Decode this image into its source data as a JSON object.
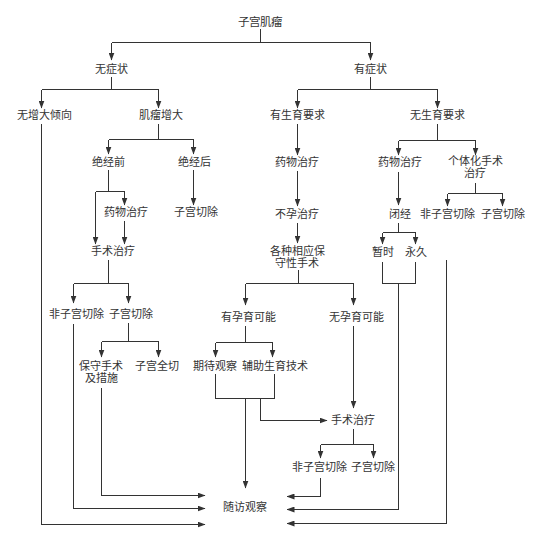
{
  "diagram": {
    "title": "子宫肌瘤",
    "colors": {
      "background": "#ffffff",
      "line": "#333333",
      "text": "#333333"
    },
    "nodes": {
      "root": {
        "label": "子宫肌瘤"
      },
      "asymptomatic": {
        "label": "无症状"
      },
      "symptomatic": {
        "label": "有症状"
      },
      "no_growth_tendency": {
        "label": "无增大倾向"
      },
      "fibroid_growth": {
        "label": "肌瘤增大"
      },
      "premenopausal": {
        "label": "绝经前"
      },
      "postmenopausal": {
        "label": "绝经后"
      },
      "drug_therapy_premeno": {
        "label": "药物治疗"
      },
      "hysterectomy_postmeno": {
        "label": "子宫切除"
      },
      "surgery_premeno": {
        "label": "手术治疗"
      },
      "non_hysterectomy_premeno": {
        "label": "非子宫切除"
      },
      "hysterectomy_premeno": {
        "label": "子宫切除"
      },
      "conservative_measures": {
        "lines": [
          "保守手术",
          "及措施"
        ]
      },
      "total_hysterectomy": {
        "label": "子宫全切"
      },
      "fertility_desired": {
        "label": "有生育要求"
      },
      "fertility_not_desired": {
        "label": "无生育要求"
      },
      "drug_therapy_fertility": {
        "label": "药物治疗"
      },
      "infertility_treatment": {
        "label": "不孕治疗"
      },
      "conservative_surgery": {
        "lines": [
          "各种相应保",
          "守性手术"
        ]
      },
      "pregnancy_possible": {
        "label": "有孕育可能"
      },
      "pregnancy_impossible": {
        "label": "无孕育可能"
      },
      "expectant_observation": {
        "label": "期待观察"
      },
      "assisted_reproduction": {
        "label": "辅助生育技术"
      },
      "surgery_fertility": {
        "label": "手术治疗"
      },
      "non_hysterectomy_fertility": {
        "label": "非子宫切除"
      },
      "hysterectomy_fertility": {
        "label": "子宫切除"
      },
      "drug_therapy_no_fertility": {
        "label": "药物治疗"
      },
      "individualized_surgery": {
        "lines": [
          "个体化手术",
          "治疗"
        ]
      },
      "amenorrhea": {
        "label": "闭经"
      },
      "temporary": {
        "label": "暂时"
      },
      "permanent": {
        "label": "永久"
      },
      "non_hysterectomy_no_fertility": {
        "label": "非子宫切除"
      },
      "hysterectomy_no_fertility": {
        "label": "子宫切除"
      },
      "follow_up": {
        "label": "随访观察"
      }
    },
    "edges": [
      [
        "root",
        "asymptomatic"
      ],
      [
        "root",
        "symptomatic"
      ],
      [
        "asymptomatic",
        "no_growth_tendency"
      ],
      [
        "asymptomatic",
        "fibroid_growth"
      ],
      [
        "no_growth_tendency",
        "follow_up"
      ],
      [
        "fibroid_growth",
        "premenopausal"
      ],
      [
        "fibroid_growth",
        "postmenopausal"
      ],
      [
        "premenopausal",
        "drug_therapy_premeno"
      ],
      [
        "premenopausal",
        "surgery_premeno"
      ],
      [
        "drug_therapy_premeno",
        "surgery_premeno"
      ],
      [
        "postmenopausal",
        "hysterectomy_postmeno"
      ],
      [
        "surgery_premeno",
        "non_hysterectomy_premeno"
      ],
      [
        "surgery_premeno",
        "hysterectomy_premeno"
      ],
      [
        "non_hysterectomy_premeno",
        "follow_up"
      ],
      [
        "hysterectomy_premeno",
        "conservative_measures"
      ],
      [
        "hysterectomy_premeno",
        "total_hysterectomy"
      ],
      [
        "conservative_measures",
        "follow_up"
      ],
      [
        "symptomatic",
        "fertility_desired"
      ],
      [
        "symptomatic",
        "fertility_not_desired"
      ],
      [
        "fertility_desired",
        "drug_therapy_fertility"
      ],
      [
        "drug_therapy_fertility",
        "infertility_treatment"
      ],
      [
        "infertility_treatment",
        "conservative_surgery"
      ],
      [
        "conservative_surgery",
        "pregnancy_possible"
      ],
      [
        "conservative_surgery",
        "pregnancy_impossible"
      ],
      [
        "pregnancy_possible",
        "expectant_observation"
      ],
      [
        "pregnancy_possible",
        "assisted_reproduction"
      ],
      [
        "expectant_observation",
        "follow_up"
      ],
      [
        "assisted_reproduction",
        "follow_up"
      ],
      [
        "expectant_observation",
        "surgery_fertility"
      ],
      [
        "assisted_reproduction",
        "surgery_fertility"
      ],
      [
        "pregnancy_impossible",
        "surgery_fertility"
      ],
      [
        "surgery_fertility",
        "non_hysterectomy_fertility"
      ],
      [
        "surgery_fertility",
        "hysterectomy_fertility"
      ],
      [
        "non_hysterectomy_fertility",
        "follow_up"
      ],
      [
        "fertility_not_desired",
        "drug_therapy_no_fertility"
      ],
      [
        "fertility_not_desired",
        "individualized_surgery"
      ],
      [
        "drug_therapy_no_fertility",
        "amenorrhea"
      ],
      [
        "amenorrhea",
        "temporary"
      ],
      [
        "amenorrhea",
        "permanent"
      ],
      [
        "temporary",
        "follow_up"
      ],
      [
        "permanent",
        "follow_up"
      ],
      [
        "individualized_surgery",
        "non_hysterectomy_no_fertility"
      ],
      [
        "individualized_surgery",
        "hysterectomy_no_fertility"
      ],
      [
        "non_hysterectomy_no_fertility",
        "follow_up"
      ]
    ]
  }
}
